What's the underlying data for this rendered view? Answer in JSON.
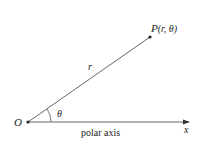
{
  "diagram": {
    "origin": {
      "label": "O",
      "x": 28,
      "y": 122
    },
    "point": {
      "label": "P",
      "coords": "(r, θ)",
      "x": 150,
      "y": 37
    },
    "radius_label": "r",
    "angle_label": "θ",
    "axis": {
      "label": "polar axis",
      "end_label": "x",
      "x_end": 190
    },
    "colors": {
      "line": "#555555",
      "text": "#222222"
    }
  }
}
